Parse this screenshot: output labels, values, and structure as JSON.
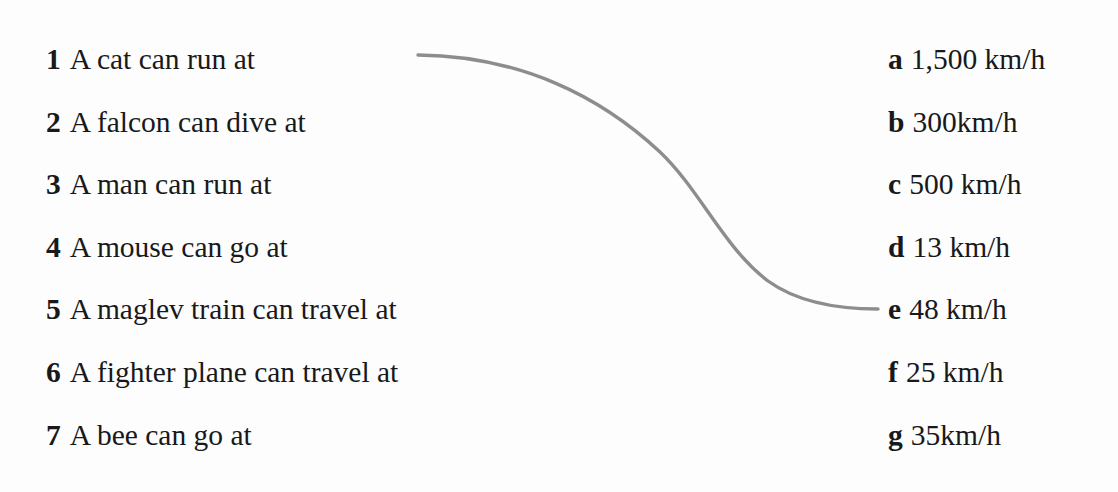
{
  "page": {
    "background_color": "#fdfdfd",
    "text_color": "#18191b"
  },
  "prompts": {
    "items": [
      {
        "marker": "1",
        "text": "A cat can run at"
      },
      {
        "marker": "2",
        "text": "A falcon can dive at"
      },
      {
        "marker": "3",
        "text": "A man can run at"
      },
      {
        "marker": "4",
        "text": "A mouse can go at"
      },
      {
        "marker": "5",
        "text": "A maglev train can travel at"
      },
      {
        "marker": "6",
        "text": "A fighter plane can travel at"
      },
      {
        "marker": "7",
        "text": "A bee can go at"
      }
    ]
  },
  "answers": {
    "items": [
      {
        "marker": "a",
        "text": "1,500 km/h"
      },
      {
        "marker": "b",
        "text": "300km/h"
      },
      {
        "marker": "c",
        "text": "500 km/h"
      },
      {
        "marker": "d",
        "text": "13 km/h"
      },
      {
        "marker": "e",
        "text": "48 km/h"
      },
      {
        "marker": "f",
        "text": "25 km/h"
      },
      {
        "marker": "g",
        "text": "35km/h"
      }
    ]
  },
  "connector": {
    "name": "match-line-1-to-e",
    "from_prompt_marker": "1",
    "to_answer_marker": "e",
    "color": "#8d8d8d",
    "stroke_width": 3.4,
    "path": "M 418 55 C 520 56 600 96 660 152 C 700 190 724 248 768 281 C 800 304 842 309 878 309"
  }
}
